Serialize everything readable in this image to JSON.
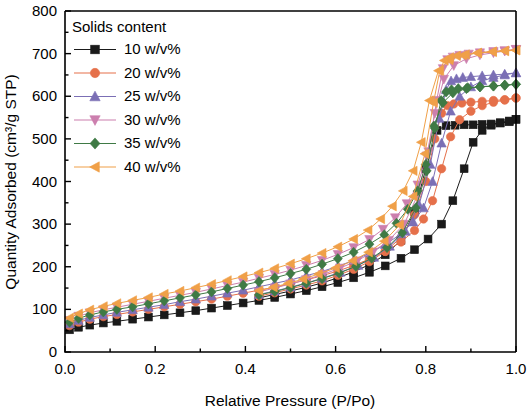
{
  "chart_data": {
    "type": "line",
    "title": "",
    "xlabel": "Relative Pressure (P/Po)",
    "ylabel": "Quantity Adsorbed (cm³/g STP)",
    "xlim": [
      0.0,
      1.0
    ],
    "ylim": [
      0,
      800
    ],
    "xticks": [
      "0.0",
      "0.2",
      "0.4",
      "0.6",
      "0.8",
      "1.0"
    ],
    "xtick_values": [
      0.0,
      0.2,
      0.4,
      0.6,
      0.8,
      1.0
    ],
    "yticks": [
      "0",
      "100",
      "200",
      "300",
      "400",
      "500",
      "600",
      "700",
      "800"
    ],
    "ytick_values": [
      0,
      100,
      200,
      300,
      400,
      500,
      600,
      700,
      800
    ],
    "grid": false,
    "legend_title": "Solids content",
    "legend_position": "top-left inside",
    "series": [
      {
        "name": "10 w/v%",
        "color": "#1a1a1a",
        "marker": "square",
        "adsorption_x": [
          0.01,
          0.03,
          0.055,
          0.085,
          0.115,
          0.15,
          0.185,
          0.22,
          0.255,
          0.29,
          0.325,
          0.36,
          0.395,
          0.43,
          0.465,
          0.5,
          0.535,
          0.57,
          0.605,
          0.64,
          0.675,
          0.71,
          0.745,
          0.775,
          0.805,
          0.835,
          0.86,
          0.885,
          0.905,
          0.925,
          0.945,
          0.965,
          0.985,
          1.0
        ],
        "adsorption_y": [
          52,
          58,
          63,
          68,
          72,
          77,
          82,
          87,
          92,
          97,
          103,
          109,
          115,
          121,
          128,
          136,
          144,
          153,
          163,
          174,
          187,
          202,
          220,
          240,
          265,
          300,
          355,
          430,
          492,
          520,
          532,
          538,
          542,
          546
        ],
        "desorption_x": [
          1.0,
          0.985,
          0.965,
          0.945,
          0.925,
          0.905,
          0.885,
          0.865,
          0.845,
          0.825,
          0.8,
          0.775,
          0.745,
          0.71,
          0.675,
          0.64,
          0.605,
          0.57,
          0.535,
          0.5,
          0.465,
          0.43
        ],
        "desorption_y": [
          546,
          540,
          537,
          535,
          534,
          533,
          533,
          532,
          531,
          520,
          430,
          330,
          262,
          228,
          205,
          188,
          174,
          162,
          152,
          143,
          135,
          127
        ]
      },
      {
        "name": "20 w/v%",
        "color": "#e5704a",
        "marker": "circle",
        "adsorption_x": [
          0.01,
          0.03,
          0.055,
          0.085,
          0.115,
          0.15,
          0.185,
          0.22,
          0.255,
          0.29,
          0.325,
          0.36,
          0.395,
          0.43,
          0.465,
          0.5,
          0.535,
          0.57,
          0.605,
          0.64,
          0.675,
          0.71,
          0.745,
          0.775,
          0.795,
          0.815,
          0.835,
          0.855,
          0.875,
          0.9,
          0.925,
          0.95,
          0.975,
          1.0
        ],
        "adsorption_y": [
          62,
          70,
          77,
          83,
          88,
          94,
          100,
          106,
          112,
          118,
          124,
          131,
          138,
          145,
          152,
          160,
          169,
          179,
          190,
          203,
          218,
          236,
          258,
          285,
          312,
          355,
          430,
          505,
          545,
          565,
          578,
          586,
          591,
          596
        ],
        "desorption_x": [
          1.0,
          0.975,
          0.95,
          0.925,
          0.9,
          0.88,
          0.862,
          0.848,
          0.835,
          0.82,
          0.8,
          0.775,
          0.745,
          0.71,
          0.675,
          0.64,
          0.605,
          0.57,
          0.535,
          0.5,
          0.465,
          0.43
        ],
        "desorption_y": [
          596,
          592,
          590,
          588,
          586,
          584,
          582,
          578,
          560,
          500,
          400,
          322,
          268,
          236,
          212,
          194,
          180,
          167,
          157,
          148,
          139,
          131
        ]
      },
      {
        "name": "25 w/v%",
        "color": "#7b6fb5",
        "marker": "triangle-up",
        "adsorption_x": [
          0.01,
          0.03,
          0.055,
          0.085,
          0.115,
          0.15,
          0.185,
          0.22,
          0.255,
          0.29,
          0.325,
          0.36,
          0.395,
          0.43,
          0.465,
          0.5,
          0.535,
          0.57,
          0.605,
          0.64,
          0.675,
          0.71,
          0.745,
          0.772,
          0.795,
          0.815,
          0.835,
          0.855,
          0.875,
          0.9,
          0.925,
          0.95,
          0.975,
          1.0
        ],
        "adsorption_y": [
          66,
          74,
          81,
          87,
          93,
          99,
          105,
          111,
          118,
          124,
          131,
          138,
          145,
          153,
          161,
          169,
          179,
          189,
          201,
          215,
          232,
          252,
          277,
          305,
          338,
          400,
          490,
          565,
          600,
          622,
          636,
          644,
          650,
          655
        ],
        "desorption_x": [
          1.0,
          0.975,
          0.95,
          0.925,
          0.9,
          0.882,
          0.868,
          0.856,
          0.845,
          0.83,
          0.81,
          0.785,
          0.755,
          0.72,
          0.685,
          0.65,
          0.61,
          0.57,
          0.535,
          0.5,
          0.465,
          0.43
        ],
        "desorption_y": [
          655,
          652,
          650,
          648,
          646,
          644,
          641,
          636,
          615,
          548,
          440,
          345,
          283,
          248,
          222,
          203,
          187,
          173,
          162,
          152,
          143,
          135
        ]
      },
      {
        "name": "30 w/v%",
        "color": "#cc7fae",
        "marker": "triangle-down",
        "adsorption_x": [
          0.01,
          0.03,
          0.055,
          0.085,
          0.115,
          0.15,
          0.185,
          0.22,
          0.255,
          0.29,
          0.325,
          0.36,
          0.395,
          0.43,
          0.465,
          0.5,
          0.535,
          0.57,
          0.605,
          0.64,
          0.675,
          0.705,
          0.732,
          0.758,
          0.782,
          0.802,
          0.82,
          0.84,
          0.862,
          0.89,
          0.92,
          0.95,
          0.975,
          1.0
        ],
        "adsorption_y": [
          74,
          84,
          92,
          99,
          105,
          112,
          119,
          126,
          133,
          140,
          148,
          156,
          164,
          173,
          182,
          192,
          203,
          215,
          229,
          245,
          264,
          288,
          315,
          348,
          392,
          460,
          560,
          640,
          672,
          688,
          697,
          702,
          706,
          710
        ],
        "desorption_x": [
          1.0,
          0.975,
          0.95,
          0.92,
          0.895,
          0.875,
          0.86,
          0.848,
          0.838,
          0.824,
          0.806,
          0.782,
          0.752,
          0.718,
          0.683,
          0.648,
          0.61,
          0.572,
          0.535,
          0.5,
          0.465,
          0.43
        ],
        "desorption_y": [
          710,
          707,
          705,
          702,
          699,
          696,
          692,
          686,
          665,
          590,
          470,
          368,
          300,
          262,
          235,
          214,
          197,
          182,
          170,
          160,
          150,
          141
        ]
      },
      {
        "name": "35 w/v%",
        "color": "#3f7a45",
        "marker": "diamond",
        "adsorption_x": [
          0.01,
          0.03,
          0.055,
          0.085,
          0.115,
          0.15,
          0.185,
          0.22,
          0.255,
          0.29,
          0.325,
          0.36,
          0.395,
          0.43,
          0.465,
          0.5,
          0.535,
          0.57,
          0.605,
          0.64,
          0.675,
          0.708,
          0.735,
          0.76,
          0.782,
          0.8,
          0.818,
          0.838,
          0.86,
          0.89,
          0.92,
          0.95,
          0.975,
          1.0
        ],
        "adsorption_y": [
          70,
          79,
          87,
          94,
          100,
          106,
          113,
          120,
          127,
          134,
          141,
          149,
          157,
          165,
          174,
          184,
          194,
          206,
          219,
          234,
          253,
          275,
          302,
          335,
          378,
          440,
          530,
          585,
          608,
          618,
          622,
          624,
          626,
          628
        ],
        "desorption_x": [
          1.0,
          0.975,
          0.95,
          0.92,
          0.893,
          0.872,
          0.857,
          0.845,
          0.834,
          0.82,
          0.802,
          0.778,
          0.748,
          0.714,
          0.68,
          0.645,
          0.608,
          0.57,
          0.535,
          0.5,
          0.465,
          0.43
        ],
        "desorption_y": [
          628,
          626,
          624,
          622,
          620,
          618,
          615,
          610,
          590,
          525,
          425,
          338,
          280,
          245,
          220,
          201,
          185,
          172,
          161,
          151,
          142,
          134
        ]
      },
      {
        "name": "40 w/v%",
        "color": "#f0a048",
        "marker": "triangle-left",
        "adsorption_x": [
          0.01,
          0.03,
          0.055,
          0.085,
          0.115,
          0.15,
          0.185,
          0.22,
          0.255,
          0.29,
          0.325,
          0.36,
          0.395,
          0.43,
          0.465,
          0.5,
          0.535,
          0.57,
          0.605,
          0.64,
          0.672,
          0.7,
          0.726,
          0.75,
          0.772,
          0.79,
          0.808,
          0.828,
          0.852,
          0.882,
          0.915,
          0.948,
          0.975,
          1.0
        ],
        "adsorption_y": [
          80,
          90,
          99,
          107,
          114,
          121,
          128,
          136,
          143,
          151,
          159,
          168,
          177,
          186,
          196,
          207,
          219,
          232,
          247,
          265,
          286,
          312,
          342,
          378,
          425,
          492,
          590,
          660,
          685,
          696,
          702,
          705,
          707,
          708
        ],
        "desorption_x": [
          1.0,
          0.975,
          0.948,
          0.915,
          0.888,
          0.868,
          0.853,
          0.841,
          0.831,
          0.817,
          0.798,
          0.772,
          0.742,
          0.708,
          0.673,
          0.638,
          0.6,
          0.562,
          0.528,
          0.495,
          0.462,
          0.43
        ],
        "desorption_y": [
          708,
          706,
          704,
          701,
          698,
          695,
          691,
          684,
          660,
          585,
          465,
          365,
          298,
          260,
          234,
          214,
          197,
          183,
          171,
          161,
          152,
          144
        ]
      }
    ]
  },
  "axes": {
    "xlabel": "Relative Pressure (P/Po)",
    "ylabel": "Quantity Adsorbed (cm³/g STP)"
  },
  "legend": {
    "title": "Solids content",
    "entries": [
      {
        "label": "10 w/v%",
        "color": "#1a1a1a",
        "marker": "square"
      },
      {
        "label": "20 w/v%",
        "color": "#e5704a",
        "marker": "circle"
      },
      {
        "label": "25 w/v%",
        "color": "#7b6fb5",
        "marker": "triangle-up"
      },
      {
        "label": "30 w/v%",
        "color": "#cc7fae",
        "marker": "triangle-down"
      },
      {
        "label": "35 w/v%",
        "color": "#3f7a45",
        "marker": "diamond"
      },
      {
        "label": "40 w/v%",
        "color": "#f0a048",
        "marker": "triangle-left"
      }
    ]
  }
}
